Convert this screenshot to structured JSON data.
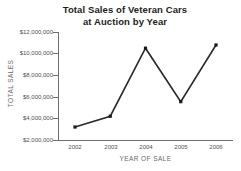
{
  "chart_data": {
    "type": "line",
    "title": "Total Sales of Veteran Cars at Auction by Year",
    "title_lines": [
      "Total Sales of Veteran Cars",
      "at Auction by Year"
    ],
    "xlabel": "YEAR OF SALE",
    "ylabel": "TOTAL SALES",
    "categories": [
      "2002",
      "2003",
      "2004",
      "2005",
      "2006"
    ],
    "x": [
      2002,
      2003,
      2004,
      2005,
      2006
    ],
    "values": [
      3200000,
      4200000,
      10500000,
      5550000,
      10800000
    ],
    "series": [
      {
        "name": "Total Sales",
        "values": [
          3200000,
          4200000,
          10500000,
          5550000,
          10800000
        ]
      }
    ],
    "ylim": [
      2000000,
      12000000
    ],
    "ytick_values": [
      2000000,
      4000000,
      6000000,
      8000000,
      10000000,
      12000000
    ],
    "ytick_labels": [
      "$2,000,000",
      "$4,000,000",
      "$6,000,000",
      "$8,000,000",
      "$10,000,000",
      "$12,000,000"
    ],
    "xtick_labels": [
      "2002",
      "2003",
      "2004",
      "2005",
      "2006"
    ],
    "grid": false,
    "legend": false,
    "marker": "square",
    "line_color": "#2b2b2b",
    "marker_color": "#1a1a1a",
    "axis_color": "#6d6d6d",
    "text_color": "#4f4f4f",
    "title_color": "#1d1d1d",
    "background": "#ffffff"
  }
}
